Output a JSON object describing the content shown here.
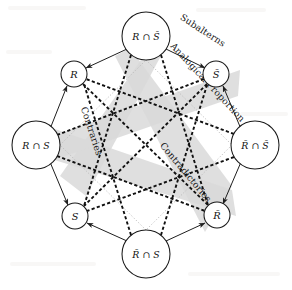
{
  "figure": {
    "type": "octagon-of-opposition",
    "background_color": "#ffffff",
    "band_color": "#d9d9d9",
    "line_color": "#111111",
    "dotted_color": "#b9b9b9"
  },
  "nodes": [
    {
      "id": "top",
      "label": "R ∩ S̄",
      "size": "big",
      "cx": 146,
      "cy": 36,
      "r": 24
    },
    {
      "id": "upper-right",
      "label": "S̄",
      "size": "small",
      "cx": 216,
      "cy": 74,
      "r": 13
    },
    {
      "id": "right",
      "label": "R̄ ∩ S̄",
      "size": "big",
      "cx": 255,
      "cy": 145,
      "r": 24
    },
    {
      "id": "lower-right",
      "label": "R̄",
      "size": "small",
      "cx": 217,
      "cy": 215,
      "r": 13
    },
    {
      "id": "bottom",
      "label": "R̄ ∩ S",
      "size": "big",
      "cx": 146,
      "cy": 254,
      "r": 24
    },
    {
      "id": "lower-left",
      "label": "S",
      "size": "small",
      "cx": 75,
      "cy": 216,
      "r": 13
    },
    {
      "id": "left",
      "label": "R ∩ S",
      "size": "big",
      "cx": 36,
      "cy": 145,
      "r": 24
    },
    {
      "id": "upper-left",
      "label": "R",
      "size": "small",
      "cx": 74,
      "cy": 74,
      "r": 13
    }
  ],
  "relations": [
    {
      "id": "subalterns",
      "label": "Subalterns",
      "x": 203,
      "y": 30,
      "rotate": 33,
      "anchor": "upper-right-outer"
    },
    {
      "id": "analogical-proportion",
      "label": "Analogical Proportion",
      "x": 205,
      "y": 78,
      "rotate": 47,
      "anchor": "upper-right-band"
    },
    {
      "id": "contraries",
      "label": "Contraries",
      "x": 92,
      "y": 130,
      "rotate": 72,
      "anchor": "left-diagonal"
    },
    {
      "id": "contradictories",
      "label": "Contradictories",
      "x": 185,
      "y": 172,
      "rotate": 50,
      "anchor": "center-right-diagonal"
    }
  ],
  "edges": {
    "solid_arrows": [
      {
        "from": "top",
        "to": "upper-left",
        "style": "arrow"
      },
      {
        "from": "top",
        "to": "upper-right",
        "style": "arrow"
      },
      {
        "from": "left",
        "to": "upper-left",
        "style": "arrow"
      },
      {
        "from": "right",
        "to": "upper-right",
        "style": "arrow"
      },
      {
        "from": "left",
        "to": "lower-left",
        "style": "arrow"
      },
      {
        "from": "right",
        "to": "lower-right",
        "style": "arrow"
      },
      {
        "from": "bottom",
        "to": "lower-left",
        "style": "arrow"
      },
      {
        "from": "bottom",
        "to": "lower-right",
        "style": "arrow"
      }
    ],
    "dashed_diagonals": [
      {
        "from": "top",
        "to": "lower-left"
      },
      {
        "from": "top",
        "to": "lower-right"
      },
      {
        "from": "bottom",
        "to": "upper-left"
      },
      {
        "from": "bottom",
        "to": "upper-right"
      },
      {
        "from": "left",
        "to": "upper-right"
      },
      {
        "from": "left",
        "to": "lower-right"
      },
      {
        "from": "right",
        "to": "upper-left"
      },
      {
        "from": "right",
        "to": "lower-left"
      },
      {
        "from": "upper-left",
        "to": "lower-right"
      },
      {
        "from": "upper-right",
        "to": "lower-left"
      }
    ],
    "dotted_inner_square": [
      {
        "from": "top",
        "to": "right"
      },
      {
        "from": "right",
        "to": "bottom"
      },
      {
        "from": "bottom",
        "to": "left"
      },
      {
        "from": "left",
        "to": "top"
      }
    ],
    "gray_bands": [
      {
        "from": "top",
        "to": "bottom",
        "via": [
          "upper-right",
          "lower-left"
        ]
      },
      {
        "from": "left",
        "to": "right",
        "via": [
          "upper-left",
          "lower-right"
        ]
      }
    ]
  }
}
